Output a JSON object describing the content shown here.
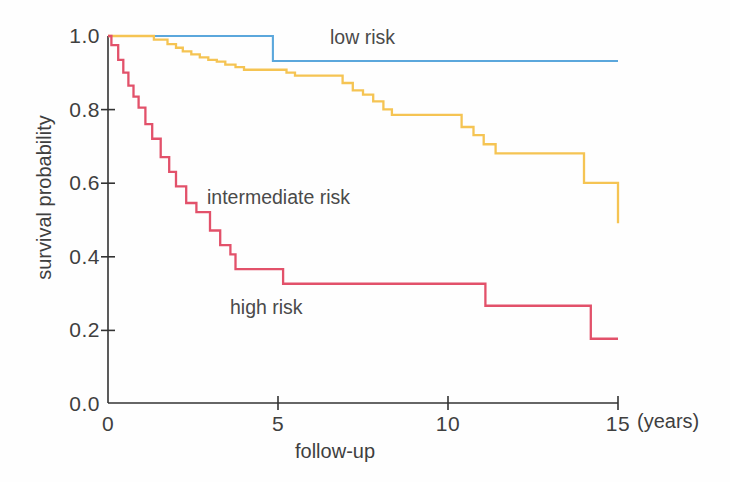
{
  "chart_data": {
    "type": "line",
    "subtype": "kaplan-meier-step",
    "title": "",
    "xlabel": "follow-up",
    "x_units": "(years)",
    "ylabel": "survival probability",
    "xlim": [
      0,
      15
    ],
    "ylim": [
      0.0,
      1.0
    ],
    "grid": false,
    "legend_position": "inline-annotations",
    "x_ticks": [
      "0",
      "5",
      "10",
      "15"
    ],
    "x_tick_values": [
      0,
      5,
      10,
      15
    ],
    "y_ticks": [
      "0.0",
      "0.2",
      "0.4",
      "0.6",
      "0.8",
      "1.0"
    ],
    "y_tick_values": [
      0.0,
      0.2,
      0.4,
      0.6,
      0.8,
      1.0
    ],
    "series": [
      {
        "name": "low risk",
        "color": "#5BA7DC",
        "label_x": 6.6,
        "label_y": 0.955,
        "x": [
          0.0,
          4.85,
          4.85,
          15.0
        ],
        "y": [
          1.0,
          1.0,
          0.932,
          0.932
        ],
        "points": [
          {
            "t": 0.0,
            "s": 1.0
          },
          {
            "t": 4.85,
            "s": 1.0
          },
          {
            "t": 4.85,
            "s": 0.932
          },
          {
            "t": 15.0,
            "s": 0.932
          }
        ]
      },
      {
        "name": "intermediate risk",
        "color": "#F5C453",
        "label_x": 3.1,
        "label_y": 0.585,
        "x": [
          0.0,
          1.35,
          1.35,
          1.75,
          1.75,
          2.0,
          2.0,
          2.2,
          2.2,
          2.45,
          2.45,
          2.7,
          2.7,
          2.95,
          2.95,
          3.2,
          3.2,
          3.45,
          3.45,
          3.75,
          3.75,
          4.0,
          4.0,
          5.25,
          5.25,
          5.5,
          5.5,
          6.9,
          6.9,
          7.2,
          7.2,
          7.5,
          7.5,
          7.8,
          7.8,
          8.1,
          8.1,
          8.35,
          8.35,
          10.4,
          10.4,
          10.75,
          10.75,
          11.05,
          11.05,
          11.4,
          11.4,
          14.0,
          14.0,
          15.0
        ],
        "y": [
          1.0,
          1.0,
          0.99,
          0.99,
          0.978,
          0.978,
          0.968,
          0.968,
          0.958,
          0.958,
          0.95,
          0.95,
          0.942,
          0.942,
          0.935,
          0.935,
          0.93,
          0.93,
          0.922,
          0.922,
          0.915,
          0.915,
          0.908,
          0.908,
          0.9,
          0.9,
          0.892,
          0.892,
          0.872,
          0.872,
          0.852,
          0.852,
          0.84,
          0.84,
          0.822,
          0.822,
          0.8,
          0.8,
          0.785,
          0.785,
          0.752,
          0.752,
          0.73,
          0.73,
          0.705,
          0.705,
          0.68,
          0.68,
          0.6,
          0.6
        ],
        "final_value": 0.49
      },
      {
        "name": "high risk",
        "color": "#E2516A",
        "label_x": 3.6,
        "label_y": 0.295,
        "x": [
          0.0,
          0.1,
          0.1,
          0.3,
          0.3,
          0.45,
          0.45,
          0.6,
          0.6,
          0.75,
          0.75,
          0.9,
          0.9,
          1.1,
          1.1,
          1.3,
          1.3,
          1.55,
          1.55,
          1.8,
          1.8,
          2.0,
          2.0,
          2.3,
          2.3,
          2.6,
          2.6,
          3.0,
          3.0,
          3.3,
          3.3,
          3.6,
          3.6,
          3.75,
          3.75,
          5.15,
          5.15,
          11.1,
          11.1,
          14.2,
          14.2,
          15.0
        ],
        "y": [
          1.0,
          1.0,
          0.975,
          0.975,
          0.935,
          0.935,
          0.9,
          0.9,
          0.865,
          0.865,
          0.835,
          0.835,
          0.805,
          0.805,
          0.76,
          0.76,
          0.72,
          0.72,
          0.67,
          0.67,
          0.63,
          0.63,
          0.59,
          0.59,
          0.545,
          0.545,
          0.52,
          0.52,
          0.47,
          0.47,
          0.43,
          0.43,
          0.405,
          0.405,
          0.365,
          0.365,
          0.325,
          0.325,
          0.265,
          0.265,
          0.175,
          0.175
        ],
        "final_value": 0.175
      }
    ]
  },
  "axes": {
    "x_title": "follow-up",
    "x_units_label": "(years)",
    "y_title": "survival probability",
    "axis_color": "#333333"
  },
  "annotations": {
    "low_risk": "low risk",
    "intermediate_risk": "intermediate risk",
    "high_risk": "high risk"
  }
}
